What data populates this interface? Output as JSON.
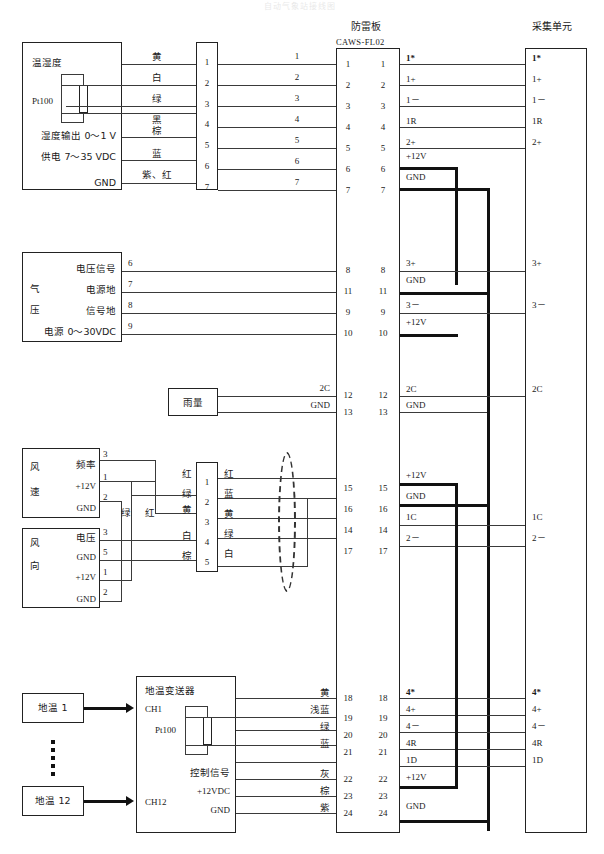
{
  "page": {
    "faint_title": "自动气象站接线图",
    "lightning_board": {
      "label": "防雷板",
      "model": "CAWS-FL02"
    },
    "acquisition_unit": {
      "label": "采集单元"
    }
  },
  "sections": {
    "temp_humidity": {
      "device_label": "温湿度",
      "sensor_label": "Pt100",
      "lines": [
        "湿度输出 0～1 V",
        "供电 7～35 VDC",
        "GND"
      ],
      "wire_colors": [
        "黄",
        "白",
        "绿",
        "黑",
        "棕",
        "蓝",
        "紫、红"
      ],
      "connector_pins": [
        "1",
        "2",
        "3",
        "4",
        "5",
        "6",
        "7"
      ],
      "cable_numbers": [
        "1",
        "2",
        "3",
        "4",
        "5",
        "6",
        "7"
      ],
      "board_left_pins": [
        "1",
        "2",
        "3",
        "4",
        "5",
        "6",
        "7"
      ],
      "board_right_pins": [
        "1",
        "2",
        "3",
        "4",
        "5",
        "6",
        "7"
      ],
      "signal_labels": [
        "1*",
        "1+",
        "1－",
        "1R",
        "2+",
        "+12V",
        "GND"
      ],
      "unit_labels": [
        "1*",
        "1+",
        "1－",
        "1R",
        "2+"
      ]
    },
    "pressure": {
      "device_label": "气压",
      "char_top": "气",
      "char_bottom": "压",
      "lines": [
        "电压信号",
        "电源地",
        "信号地",
        "电源 0～30VDC"
      ],
      "cable_numbers": [
        "6",
        "7",
        "8",
        "9"
      ],
      "board_left_pins": [
        "8",
        "11",
        "9",
        "10"
      ],
      "board_right_pins": [
        "8",
        "11",
        "9",
        "10"
      ],
      "signal_labels": [
        "3+",
        "GND",
        "3－",
        "+12V"
      ],
      "unit_labels": [
        "3+",
        "3－"
      ]
    },
    "rain": {
      "device_label": "雨量",
      "wire_labels": [
        "2C",
        "GND"
      ],
      "board_left_pins": [
        "12",
        "13"
      ],
      "board_right_pins": [
        "12",
        "13"
      ],
      "signal_labels": [
        "2C",
        "GND"
      ],
      "unit_labels": [
        "2C"
      ]
    },
    "wind": {
      "speed": {
        "char_top": "风",
        "char_bottom": "速",
        "terminals": [
          "频率",
          "+12V",
          "GND"
        ],
        "pin_numbers": [
          "3",
          "1",
          "2"
        ]
      },
      "direction": {
        "char_top": "风",
        "char_bottom": "向",
        "terminals": [
          "电压",
          "GND",
          "+12V",
          "GND"
        ],
        "pin_numbers": [
          "3",
          "5",
          "1",
          "2"
        ]
      },
      "link_colors": [
        "绿",
        "红"
      ],
      "left_wire_colors": [
        "红",
        "绿",
        "黄",
        "白",
        "棕"
      ],
      "connector_pins": [
        "1",
        "2",
        "3",
        "4",
        "5"
      ],
      "right_wire_colors": [
        "红",
        "蓝",
        "黄",
        "绿",
        "白"
      ],
      "board_left_pins": [
        "15",
        "16",
        "14",
        "17"
      ],
      "board_right_pins": [
        "15",
        "16",
        "14",
        "17"
      ],
      "signal_labels": [
        "+12V",
        "GND",
        "1C",
        "2－"
      ],
      "unit_labels": [
        "1C",
        "2－"
      ]
    },
    "soil": {
      "sensor_first": "地温 1",
      "sensor_last": "地温 12",
      "transmitter_label": "地温变送器",
      "channel_first": "CH1",
      "channel_last": "CH12",
      "sensor_type": "Pt100",
      "control_lines": [
        "控制信号",
        "+12VDC",
        "GND"
      ],
      "wire_colors": [
        "黄",
        "浅蓝",
        "绿",
        "蓝",
        "灰",
        "棕",
        "紫"
      ],
      "board_left_pins": [
        "18",
        "19",
        "20",
        "21",
        "22",
        "23",
        "24"
      ],
      "board_right_pins": [
        "18",
        "19",
        "20",
        "21",
        "22",
        "23",
        "24"
      ],
      "signal_labels": [
        "4*",
        "4+",
        "4－",
        "4R",
        "1D",
        "+12V",
        "GND"
      ],
      "unit_labels": [
        "4*",
        "4+",
        "4－",
        "4R",
        "1D"
      ]
    }
  }
}
